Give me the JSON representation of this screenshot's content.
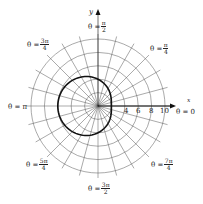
{
  "chart_data": {
    "type": "polar",
    "title": "",
    "curve": "r = 4 - 2cos(theta)",
    "rings": [
      2,
      4,
      6,
      8,
      10
    ],
    "radial_tick_labels": [
      "4",
      "6",
      "8",
      "10"
    ],
    "radial_line_step_deg": 15,
    "axis_labels": {
      "x": "x",
      "y": "y"
    },
    "angle_labels": [
      {
        "id": "a0",
        "prefix": "θ = ",
        "num": "0",
        "den": ""
      },
      {
        "id": "a45",
        "prefix": "θ = ",
        "num": "π",
        "den": "4"
      },
      {
        "id": "a90",
        "prefix": "θ = ",
        "num": "π",
        "den": "2"
      },
      {
        "id": "a135",
        "prefix": "θ = ",
        "num": "3π",
        "den": "4"
      },
      {
        "id": "a180",
        "prefix": "θ = ",
        "num": "π",
        "den": ""
      },
      {
        "id": "a225",
        "prefix": "θ = ",
        "num": "5π",
        "den": "4"
      },
      {
        "id": "a270",
        "prefix": "θ = ",
        "num": "3π",
        "den": "2"
      },
      {
        "id": "a315",
        "prefix": "θ = ",
        "num": "7π",
        "den": "4"
      }
    ],
    "sample_points": [
      {
        "theta": "0",
        "r": 2
      },
      {
        "theta": "π/2",
        "r": 4
      },
      {
        "theta": "π",
        "r": 6
      },
      {
        "theta": "3π/2",
        "r": 4
      }
    ]
  },
  "labels": {
    "x_axis": "x",
    "y_axis": "y",
    "theta0": "θ = 0",
    "thetapi": "θ = π",
    "t4": "4",
    "t6": "6",
    "t8": "8",
    "t10": "10",
    "eq": "θ = ",
    "pi": "π",
    "threepi": "3π",
    "fivepi": "5π",
    "sevenpi": "7π",
    "d2": "2",
    "d4": "4"
  }
}
